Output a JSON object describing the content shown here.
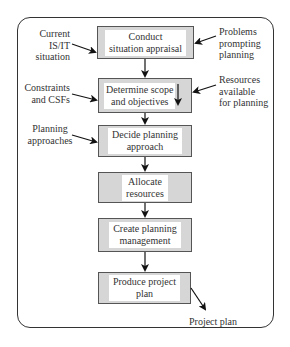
{
  "diagram": {
    "steps": [
      {
        "id": "conduct",
        "label_line1": "Conduct",
        "label_line2": "situation appraisal"
      },
      {
        "id": "scope",
        "label_line1": "Determine scope",
        "label_line2": "and objectives"
      },
      {
        "id": "approach",
        "label_line1": "Decide planning",
        "label_line2": "approach"
      },
      {
        "id": "allocate",
        "label_line1": "Allocate",
        "label_line2": "resources"
      },
      {
        "id": "management",
        "label_line1": "Create planning",
        "label_line2": "management"
      },
      {
        "id": "produce",
        "label_line1": "Produce project",
        "label_line2": "plan"
      }
    ],
    "inputs_left": [
      {
        "line1": "Current",
        "line2": "IS/IT",
        "line3": "situation"
      },
      {
        "line1": "Constraints",
        "line2": "and CSFs"
      },
      {
        "line1": "Planning",
        "line2": "approaches"
      }
    ],
    "inputs_right": [
      {
        "line1": "Problems",
        "line2": "prompting",
        "line3": "planning"
      },
      {
        "line1": "Resources",
        "line2": "available",
        "line3": "for planning"
      }
    ],
    "output": {
      "label": "Project plan"
    },
    "colors": {
      "box_fill": "#d6d6d6",
      "box_border": "#555555",
      "inner_fill": "#ffffff",
      "arrow": "#111111",
      "frame": "#333333"
    }
  }
}
